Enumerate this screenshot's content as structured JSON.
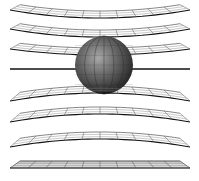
{
  "figure": {
    "title": "",
    "colors": {
      "background": "#ffffff",
      "grid_line": "#333333",
      "grid_edge": "#111111",
      "sphere_dark": "#2a2a2a",
      "sphere_mid": "#6b6b6b",
      "sphere_light": "#b8b8b8",
      "flat_grid_fill": "#d9d9d9"
    },
    "sphere": {
      "cx": 104,
      "cy": 65,
      "r": 29
    },
    "layers": [
      {
        "name": "layer-1",
        "y": 10,
        "curvature": 8,
        "type": "sag"
      },
      {
        "name": "layer-2",
        "y": 29,
        "curvature": 8,
        "type": "sag"
      },
      {
        "name": "layer-3",
        "y": 49,
        "curvature": 6,
        "type": "sag"
      },
      {
        "name": "layer-4",
        "y": 69,
        "curvature": 0,
        "type": "edge"
      },
      {
        "name": "layer-5",
        "y": 101,
        "curvature": -8,
        "type": "bulge"
      },
      {
        "name": "layer-6",
        "y": 122,
        "curvature": -8,
        "type": "bulge"
      },
      {
        "name": "layer-7",
        "y": 147,
        "curvature": -8,
        "type": "bulge"
      },
      {
        "name": "layer-8",
        "y": 168,
        "curvature": 0,
        "type": "flat"
      }
    ]
  }
}
